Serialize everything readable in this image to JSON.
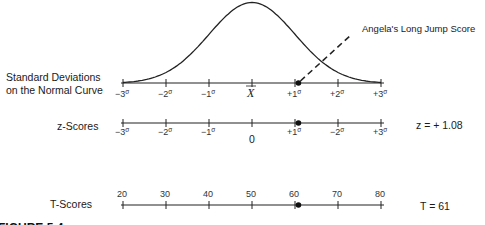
{
  "figure": {
    "caption": "FIGURE 5.4",
    "annotation": "Angela's Long Jump Score",
    "rows": {
      "normal_curve": {
        "label_line1": "Standard Deviations",
        "label_line2": "on the Normal Curve",
        "ticks": [
          {
            "sign": "−3",
            "sym": "σ"
          },
          {
            "sign": "−2",
            "sym": "σ"
          },
          {
            "sign": "−1",
            "sym": "σ"
          },
          {
            "sign": "X",
            "sym": ""
          },
          {
            "sign": "+1",
            "sym": "σ"
          },
          {
            "sign": "+2",
            "sym": "σ"
          },
          {
            "sign": "+3",
            "sym": "σ"
          }
        ],
        "mean_symbol": "X"
      },
      "z_scores": {
        "label": "z-Scores",
        "ticks": [
          {
            "sign": "−3",
            "sym": "σ"
          },
          {
            "sign": "−2",
            "sym": "σ"
          },
          {
            "sign": "−1",
            "sym": "σ"
          },
          {
            "sign": "",
            "sym": ""
          },
          {
            "sign": "+1",
            "sym": "σ"
          },
          {
            "sign": "−2",
            "sym": "σ"
          },
          {
            "sign": "+3",
            "sym": "σ"
          }
        ],
        "zero_label": "0",
        "value_text": "z = + 1.08"
      },
      "t_scores": {
        "label": "T-Scores",
        "ticks": [
          "20",
          "30",
          "40",
          "50",
          "60",
          "70",
          "80"
        ],
        "value_text": "T = 61"
      }
    }
  },
  "chart_data": {
    "type": "line",
    "title": "FIGURE 5.4",
    "x_range_sd": [
      -3,
      3
    ],
    "curve": "standard normal density",
    "scales": {
      "sd_ticks": [
        -3,
        -2,
        -1,
        0,
        1,
        2,
        3
      ],
      "z_ticks": [
        -3,
        -2,
        -1,
        0,
        1,
        2,
        3
      ],
      "t_ticks": [
        20,
        30,
        40,
        50,
        60,
        70,
        80
      ]
    },
    "marked_score": {
      "label": "Angela's Long Jump Score",
      "z": 1.08,
      "T": 61
    }
  }
}
